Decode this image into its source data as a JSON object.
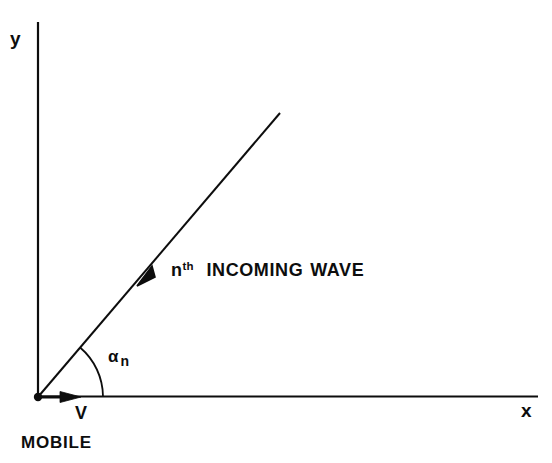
{
  "figure": {
    "background_color": "#ffffff",
    "ink_color": "#0d0d0d",
    "width": 552,
    "height": 463,
    "caption": ""
  },
  "axes": {
    "y_label": "y",
    "x_label": "x",
    "origin": {
      "x": 38,
      "y": 397
    },
    "y_axis": {
      "x1": 38,
      "y1": 22,
      "x2": 38,
      "y2": 397
    },
    "x_axis": {
      "x1": 38,
      "y1": 396,
      "x2": 538,
      "y2": 396
    }
  },
  "origin_marker": {
    "name": "origin-dot",
    "radius": 4
  },
  "ray": {
    "label_main": "INCOMING",
    "label_second": "WAVE",
    "label_prefix": "n",
    "label_superscript": "th",
    "start": {
      "x": 38,
      "y": 397
    },
    "end": {
      "x": 280,
      "y": 113
    },
    "angle_degrees": 49.6,
    "arrowhead": {
      "x": 147,
      "y": 275,
      "direction": "toward-origin"
    }
  },
  "angle": {
    "symbol": "α",
    "subscript": "n",
    "arc_radius": 65,
    "arc_start_degrees": 0,
    "arc_end_degrees": 49.6
  },
  "velocity": {
    "label": "V",
    "start": {
      "x": 38,
      "y": 397
    },
    "end": {
      "x": 80,
      "y": 397
    }
  },
  "mobile": {
    "label": "MOBILE"
  }
}
